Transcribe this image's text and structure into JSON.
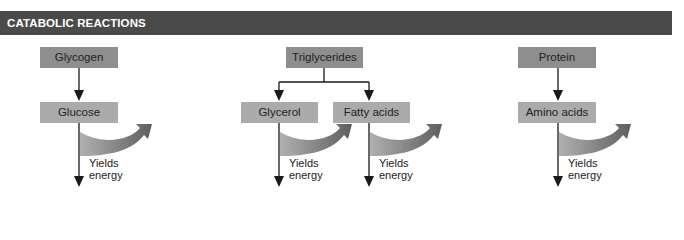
{
  "header": {
    "title": "CATABOLIC REACTIONS"
  },
  "colors": {
    "header_bg": "#4a4a4a",
    "source_box": "#8e8e8e",
    "product_box": "#ababab",
    "energy_arrow_start": "#b0b0b0",
    "energy_arrow_end": "#606060",
    "arrow": "#1a1a1a"
  },
  "pathways": [
    {
      "source": "Glycogen",
      "products": [
        {
          "label": "Glucose",
          "energy_label_line1": "Yields",
          "energy_label_line2": "energy"
        }
      ]
    },
    {
      "source": "Triglycerides",
      "products": [
        {
          "label": "Glycerol",
          "energy_label_line1": "Yields",
          "energy_label_line2": "energy"
        },
        {
          "label": "Fatty acids",
          "energy_label_line1": "Yields",
          "energy_label_line2": "energy"
        }
      ]
    },
    {
      "source": "Protein",
      "products": [
        {
          "label": "Amino acids",
          "energy_label_line1": "Yields",
          "energy_label_line2": "energy"
        }
      ]
    }
  ]
}
